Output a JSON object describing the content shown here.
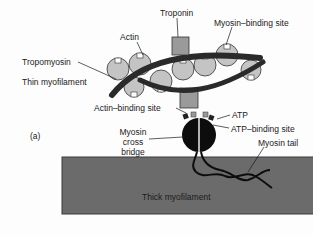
{
  "figure": {
    "panel_label": "(a)",
    "labels": {
      "troponin": "Troponin",
      "actin": "Actin",
      "myosin_binding_site": "Myosin–binding site",
      "tropomyosin": "Tropomyosin",
      "thin_myofilament": "Thin myofilament",
      "actin_binding_site": "Actin–binding site",
      "atp": "ATP",
      "atp_binding_site": "ATP–binding site",
      "myosin_cross_bridge_1": "Myosin",
      "myosin_cross_bridge_2": "cross",
      "myosin_cross_bridge_3": "bridge",
      "myosin_tail": "Myosin tail",
      "thick_myofilament": "Thick myofilament"
    },
    "colors": {
      "actin_fill": "#c4c4c4",
      "strand": "#2a2a2a",
      "troponin_fill": "#9a9a9a",
      "thick_filament": "#6b6b6b",
      "myosin_head": "#0d0d0d"
    }
  }
}
